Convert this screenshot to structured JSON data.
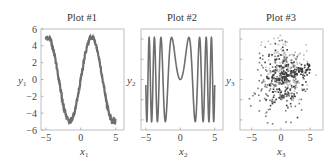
{
  "figure": {
    "panels": [
      {
        "title": "Plot #1",
        "xlabel": "x",
        "xsub": "1",
        "ylabel": "y",
        "ysub": "1"
      },
      {
        "title": "Plot #2",
        "xlabel": "x",
        "xsub": "2",
        "ylabel": "y",
        "ysub": "2"
      },
      {
        "title": "Plot #3",
        "xlabel": "x",
        "xsub": "3",
        "ylabel": "y",
        "ysub": "3"
      }
    ],
    "colors": {
      "line": "#6e6e6e",
      "frame": "#b0b0b0",
      "dark": "#3a3a3a",
      "mid": "#7a7a7a",
      "light": "#bdbdbd"
    }
  },
  "chart_data": [
    {
      "type": "line",
      "title": "Plot #1",
      "xlabel": "x1",
      "ylabel": "y1",
      "function": "y = 5*sin(x) + small noise",
      "x": [
        -5,
        -4.71,
        -4,
        -3,
        -2,
        -1.57,
        -1,
        0,
        1,
        1.57,
        2,
        3,
        4,
        5
      ],
      "y": [
        4.8,
        5.0,
        3.8,
        -0.7,
        -4.5,
        -5.0,
        -4.2,
        0,
        4.2,
        5.0,
        4.5,
        0.7,
        -3.8,
        -4.8
      ],
      "xlim": [
        -5.7,
        6.2
      ],
      "ylim": [
        -6,
        6
      ],
      "xticks": [
        -5,
        0,
        5
      ],
      "yticks": [
        -6,
        -4,
        -2,
        0,
        2,
        4,
        6
      ],
      "grid": false
    },
    {
      "type": "line",
      "title": "Plot #2",
      "xlabel": "x2",
      "ylabel": "y2",
      "function": "y = sin(x^2)",
      "x": [
        -5,
        -2.17,
        -1.25,
        0,
        1.25,
        2.17,
        5
      ],
      "y": [
        -0.13,
        -1,
        1,
        0,
        1,
        -1,
        -0.13
      ],
      "xlim": [
        -5.7,
        6.2
      ],
      "ylim": [
        -1.2,
        1.2
      ],
      "xticks": [
        -5,
        0,
        5
      ],
      "yticks": [],
      "grid": false
    },
    {
      "type": "scatter",
      "title": "Plot #3",
      "xlabel": "x3",
      "ylabel": "y3",
      "description": "~600 points, three overlapping clusters in gray shades centered near (0,0) with spread ~2",
      "xlim": [
        -7,
        7.2
      ],
      "ylim": [
        -6,
        6
      ],
      "xticks": [
        -5,
        0,
        5
      ],
      "yticks": [],
      "grid": false
    }
  ]
}
